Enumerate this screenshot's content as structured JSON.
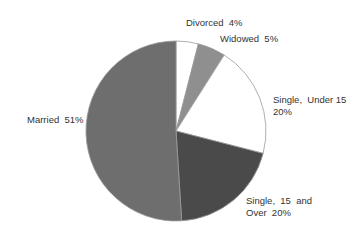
{
  "chart_data": {
    "type": "pie",
    "title": "",
    "start_angle_deg": 0,
    "direction": "clockwise",
    "center": [
      176,
      131
    ],
    "radius": 90,
    "slices": [
      {
        "label": "Divorced",
        "value": 4,
        "display": "Divorced  4%",
        "color": "#ffffff"
      },
      {
        "label": "Widowed",
        "value": 5,
        "display": "Widowed  5%",
        "color": "#8f8f8f"
      },
      {
        "label": "Single, Under 15",
        "value": 20,
        "display": "Single, Under 15 20%",
        "color": "#ffffff"
      },
      {
        "label": "Single, 15 and Over",
        "value": 20,
        "display": "Single, 15 and Over 20%",
        "color": "#4a4a4a"
      },
      {
        "label": "Married",
        "value": 51,
        "display": "Married 51%",
        "color": "#6e6e6e"
      }
    ],
    "categories": [
      "Divorced",
      "Widowed",
      "Single, Under 15",
      "Single, 15 and Over",
      "Married"
    ],
    "values": [
      4,
      5,
      20,
      20,
      51
    ],
    "legend": "none (labels placed beside slices)",
    "labels": [
      {
        "lines": [
          "Divorced  4%"
        ],
        "x": 186,
        "y": 26
      },
      {
        "lines": [
          "Widowed  5%"
        ],
        "x": 220,
        "y": 42
      },
      {
        "lines": [
          "Single,  Under 15",
          "20%"
        ],
        "x": 273,
        "y": 103
      },
      {
        "lines": [
          "Single,  15  and",
          "Over  20%"
        ],
        "x": 246,
        "y": 204
      },
      {
        "lines": [
          "Married  51%"
        ],
        "x": 27,
        "y": 123
      }
    ]
  }
}
